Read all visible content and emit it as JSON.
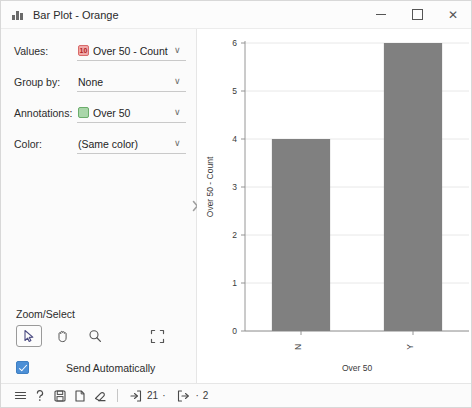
{
  "window": {
    "title": "Bar Plot - Orange",
    "icon": "bar-chart-icon",
    "controls": {
      "minimize": "–",
      "maximize": "□",
      "close": "✕"
    }
  },
  "controls": {
    "rows": [
      {
        "label": "Values:",
        "value": "Over 50 - Count",
        "icon": "numeric-variable-icon",
        "icon_type": "num",
        "icon_glyph": "10"
      },
      {
        "label": "Group by:",
        "value": "None",
        "icon": null,
        "icon_type": null,
        "icon_glyph": ""
      },
      {
        "label": "Annotations:",
        "value": "Over 50",
        "icon": "categorical-variable-icon",
        "icon_type": "cat",
        "icon_glyph": "C"
      },
      {
        "label": "Color:",
        "value": "(Same color)",
        "icon": null,
        "icon_type": null,
        "icon_glyph": ""
      }
    ],
    "chevron": "∨"
  },
  "zoom_select": {
    "title": "Zoom/Select",
    "tools": [
      {
        "name": "select-arrow-tool",
        "active": true
      },
      {
        "name": "pan-hand-tool",
        "active": false
      },
      {
        "name": "zoom-magnifier-tool",
        "active": false
      },
      {
        "name": "reset-zoom-tool",
        "active": false
      }
    ]
  },
  "send": {
    "label": "Send Automatically",
    "checked": true
  },
  "statusbar": {
    "icons": [
      "menu-icon",
      "help-icon",
      "save-icon",
      "report-icon",
      "clear-icon"
    ],
    "input_count": "21",
    "output_count": "2",
    "input_icon": "input-arrow-icon",
    "output_icon": "output-arrow-icon",
    "dot": "·"
  },
  "splitter": {
    "icon": "chevron-right-icon"
  },
  "chart_data": {
    "type": "bar",
    "title": "",
    "categories": [
      "N",
      "Y"
    ],
    "values": [
      4,
      6
    ],
    "xlabel": "Over 50",
    "ylabel": "Over 50 - Count",
    "ylim": [
      0,
      6
    ],
    "yticks": [
      0,
      1,
      2,
      3,
      4,
      5,
      6
    ],
    "grid": true,
    "legend": false,
    "bar_color": "#808080",
    "tick_label_rotation": 90
  }
}
